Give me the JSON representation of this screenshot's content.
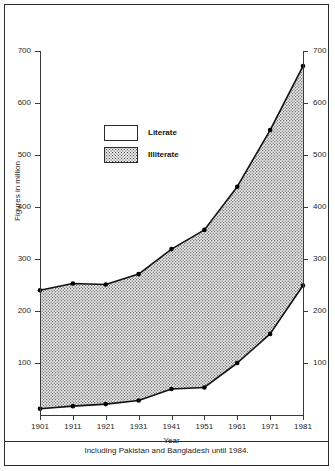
{
  "chart_data": {
    "type": "area",
    "title": "",
    "xlabel": "Year",
    "ylabel": "Figures in million",
    "categories": [
      1901,
      1911,
      1921,
      1931,
      1941,
      1951,
      1961,
      1971,
      1981
    ],
    "xtick_labels": [
      "1901",
      "1911",
      "1921",
      "1931",
      "1941",
      "1951",
      "1961",
      "1971",
      "1981"
    ],
    "ytick_labels": [
      "100",
      "200",
      "300",
      "400",
      "500",
      "600",
      "700"
    ],
    "ytick_values": [
      100,
      200,
      300,
      400,
      500,
      600,
      700
    ],
    "ylim": [
      0,
      700
    ],
    "xlim": [
      1901,
      1981
    ],
    "grid": false,
    "legend_position": "upper-left-inside",
    "series": [
      {
        "name": "Total population",
        "role": "upper-boundary",
        "values": [
          240,
          253,
          251,
          271,
          319,
          356,
          439,
          548,
          671
        ]
      },
      {
        "name": "Literate",
        "role": "lower-boundary",
        "values": [
          12,
          17,
          21,
          28,
          50,
          53,
          100,
          156,
          249
        ]
      }
    ],
    "bands": [
      {
        "name": "Literate",
        "fill": "white",
        "between": [
          "baseline",
          "Literate"
        ]
      },
      {
        "name": "Illiterate",
        "fill": "dotted-grey",
        "between": [
          "Literate",
          "Total population"
        ]
      }
    ],
    "annotations": [
      "Including Pakistan and Bangladesh until 1984."
    ]
  },
  "legend": {
    "items": [
      {
        "label": "Literate",
        "pattern": "solid-white"
      },
      {
        "label": "Illiterate",
        "pattern": "dotted-grey"
      }
    ]
  },
  "axes": {
    "left_labels": [
      "700",
      "600",
      "500",
      "400",
      "300",
      "200",
      "100"
    ],
    "right_labels": [
      "700",
      "600",
      "500",
      "400",
      "300",
      "200",
      "100"
    ],
    "x_labels": [
      "1901",
      "1911",
      "1921",
      "1931",
      "1941",
      "1951",
      "1961",
      "1971",
      "1981"
    ],
    "x_title": "Year",
    "y_title": "Figures in million"
  },
  "footnote": {
    "text": "Including Pakistan and Bangladesh until 1984."
  },
  "colors": {
    "line": "#111111",
    "marker": "#000000",
    "axis": "#3a3a3a",
    "frame": "#2b2b2b",
    "illiterate_fill": "#e9e9e9",
    "literate_fill": "#ffffff",
    "text": "#1f1f1f"
  }
}
